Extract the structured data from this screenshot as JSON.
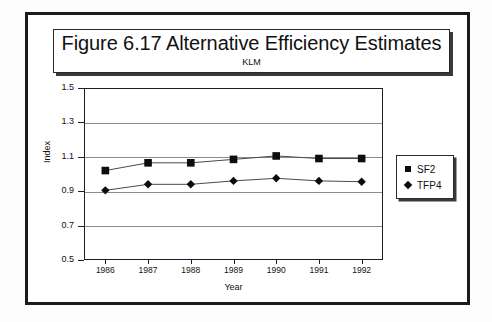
{
  "figure": {
    "title_main": "Figure 6.17  Alternative Efficiency Estimates",
    "title_sub": "KLM"
  },
  "axes": {
    "y_title": "Index",
    "x_title": "Year"
  },
  "legend": {
    "items": [
      {
        "label": "SF2",
        "marker": "square-marker-icon"
      },
      {
        "label": "TFP4",
        "marker": "diamond-marker-icon"
      }
    ]
  },
  "chart_data": {
    "type": "line",
    "title": "Figure 6.17  Alternative Efficiency Estimates",
    "subtitle": "KLM",
    "xlabel": "Year",
    "ylabel": "Index",
    "categories": [
      "1986",
      "1987",
      "1988",
      "1989",
      "1990",
      "1991",
      "1992"
    ],
    "x": [
      1986,
      1987,
      1988,
      1989,
      1990,
      1991,
      1992
    ],
    "ylim": [
      0.5,
      1.5
    ],
    "yticks": [
      "0.5",
      "0.7",
      "0.9",
      "1.1",
      "1.3",
      "1.5"
    ],
    "ytick_values": [
      0.5,
      0.7,
      0.9,
      1.1,
      1.3,
      1.5
    ],
    "grid": true,
    "legend_position": "right",
    "series": [
      {
        "name": "SF2",
        "marker": "square",
        "values": [
          1.02,
          1.065,
          1.065,
          1.085,
          1.105,
          1.09,
          1.09
        ]
      },
      {
        "name": "TFP4",
        "marker": "diamond",
        "values": [
          0.905,
          0.94,
          0.94,
          0.96,
          0.975,
          0.96,
          0.955
        ]
      }
    ]
  }
}
